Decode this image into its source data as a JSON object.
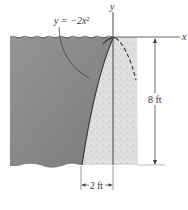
{
  "diagram": {
    "equation_label": "y = −2x²",
    "axis_x_label": "x",
    "axis_y_label": "y",
    "height_dimension": "8 ft",
    "width_dimension": "2 ft",
    "colors": {
      "water": "#8a8a8a",
      "plate": "#dcdcdc",
      "lines": "#333333",
      "background": "#ffffff"
    }
  }
}
